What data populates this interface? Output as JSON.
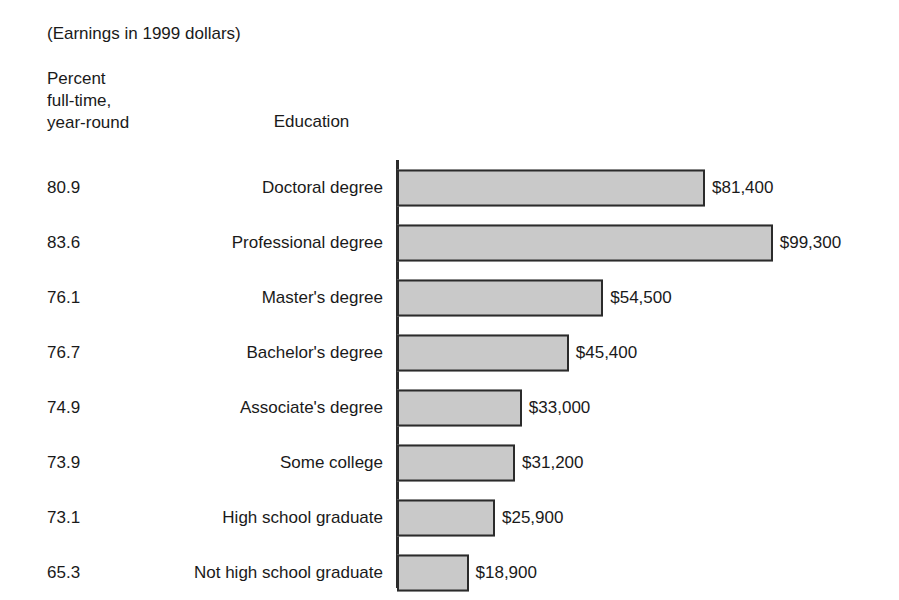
{
  "header": {
    "note": "(Earnings in 1999 dollars)",
    "percent_header_lines": [
      "Percent",
      "full-time,",
      "year-round"
    ],
    "education_header": "Education"
  },
  "chart_data": {
    "type": "bar",
    "orientation": "horizontal",
    "title": "(Earnings in 1999 dollars)",
    "xlabel": "",
    "ylabel": "Education",
    "grid": false,
    "legend": "none",
    "xlim": [
      0,
      99300
    ],
    "categories": [
      "Doctoral degree",
      "Professional degree",
      "Master's degree",
      "Bachelor's degree",
      "Associate's degree",
      "Some college",
      "High school graduate",
      "Not high school graduate"
    ],
    "values": [
      81400,
      99300,
      54500,
      45400,
      33000,
      31200,
      25900,
      18900
    ],
    "value_labels": [
      "$81,400",
      "$99,300",
      "$54,500",
      "$45,400",
      "$33,000",
      "$31,200",
      "$25,900",
      "$18,900"
    ],
    "series": [
      {
        "name": "Median earnings",
        "values": [
          81400,
          99300,
          54500,
          45400,
          33000,
          31200,
          25900,
          18900
        ]
      },
      {
        "name": "Percent full-time, year-round",
        "values": [
          80.9,
          83.6,
          76.1,
          76.7,
          74.9,
          73.9,
          73.1,
          65.3
        ]
      }
    ],
    "percent_labels": [
      "80.9",
      "83.6",
      "76.1",
      "76.7",
      "74.9",
      "73.9",
      "73.1",
      "65.3"
    ],
    "bar_fill_color": "#c9c9c9",
    "bar_border_color": "#2b2b2b",
    "rows": [
      {
        "percent": "80.9",
        "category": "Doctoral degree",
        "value": 81400,
        "value_label": "$81,400"
      },
      {
        "percent": "83.6",
        "category": "Professional degree",
        "value": 99300,
        "value_label": "$99,300"
      },
      {
        "percent": "76.1",
        "category": "Master's degree",
        "value": 54500,
        "value_label": "$54,500"
      },
      {
        "percent": "76.7",
        "category": "Bachelor's degree",
        "value": 45400,
        "value_label": "$45,400"
      },
      {
        "percent": "74.9",
        "category": "Associate's degree",
        "value": 33000,
        "value_label": "$33,000"
      },
      {
        "percent": "73.9",
        "category": "Some college",
        "value": 31200,
        "value_label": "$31,200"
      },
      {
        "percent": "73.1",
        "category": "High school graduate",
        "value": 25900,
        "value_label": "$25,900"
      },
      {
        "percent": "65.3",
        "category": "Not high school graduate",
        "value": 18900,
        "value_label": "$18,900"
      }
    ],
    "px_per_dollar": 0.003784
  }
}
